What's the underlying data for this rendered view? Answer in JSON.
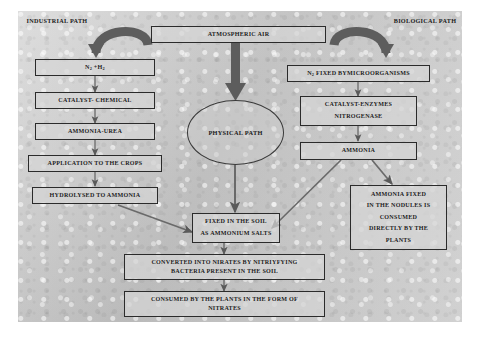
{
  "diagram": {
    "background_color": "#c8c8c8",
    "line_color": "#555555",
    "box_border_color": "#2b2b2b"
  },
  "path_labels": {
    "industrial": {
      "line1": "INDUSTRIAL",
      "line2": "PATH"
    },
    "biological": {
      "line1": "BIOLOGICAL",
      "line2": "PATH"
    }
  },
  "source": {
    "atmospheric_air": "ATMOSPHERIC AIR"
  },
  "center": {
    "physical_path": "PHYSICAL PATH"
  },
  "industrial_chain": [
    {
      "id": "n2-h2",
      "line1": "N2 +H2"
    },
    {
      "id": "catalyst-chemical",
      "line1": "CATALYST- CHEMICAL"
    },
    {
      "id": "ammonia-urea",
      "line1": "AMMONIA-UREA"
    },
    {
      "id": "application-crops",
      "line1": "APPLICATION TO THE CROPS"
    },
    {
      "id": "hydrolysed-ammonia",
      "line1": "HYDROLYSED TO AMMONIA"
    }
  ],
  "biological_chain": [
    {
      "id": "n2-fixed-microorganisms",
      "line1": "N2 FIXED BYMICROORGANISMS"
    },
    {
      "id": "catalyst-enzymes",
      "line1": "CATALYST-ENZYMES",
      "line2": "NITROGENASE"
    },
    {
      "id": "ammonia",
      "line1": "AMMONIA"
    }
  ],
  "soil_chain": [
    {
      "id": "fixed-in-soil",
      "line1": "FIXED IN THE SOIL",
      "line2": "AS AMMONIUM SALTS"
    },
    {
      "id": "converted-nitrates",
      "line1": "CONVERTED INTO NIRATES BY NITRIYFYING",
      "line2": "BACTERIA PRESENT IN THE SOIL"
    },
    {
      "id": "consumed-by-plants",
      "line1": "CONSUMED BY THE PLANTS IN THE FORM OF",
      "line2": "NITRATES"
    }
  ],
  "nodules_box": {
    "id": "ammonia-fixed-nodules",
    "line1": "AMMONIA FIXED",
    "line2": "IN THE NODULES IS",
    "line3": "CONSUMED",
    "line4": "DIRECTLY BY THE",
    "line5": "PLANTS"
  }
}
